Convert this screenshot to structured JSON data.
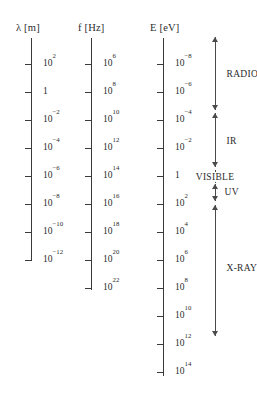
{
  "figure": {
    "type": "electromagnetic-spectrum-scale-diagram",
    "background_color": "#ffffff",
    "line_color": "#3a3a3a",
    "text_color": "#2b2b2b"
  },
  "axes": [
    {
      "id": "wavelength",
      "header": "λ [m]",
      "symbol": "λ",
      "unit": "m",
      "x": 31,
      "line_top": 38,
      "line_bottom": 260,
      "label_x": 43,
      "header_x": 16,
      "header_y": 22,
      "ticks": [
        {
          "y": 64,
          "mantissa": "10",
          "exponent": "2"
        },
        {
          "y": 92,
          "mantissa": "1",
          "exponent": ""
        },
        {
          "y": 120,
          "mantissa": "10",
          "exponent": "−2"
        },
        {
          "y": 148,
          "mantissa": "10",
          "exponent": "−4"
        },
        {
          "y": 176,
          "mantissa": "10",
          "exponent": "−6"
        },
        {
          "y": 204,
          "mantissa": "10",
          "exponent": "−8"
        },
        {
          "y": 232,
          "mantissa": "10",
          "exponent": "−10"
        },
        {
          "y": 260,
          "mantissa": "10",
          "exponent": "−12"
        }
      ]
    },
    {
      "id": "frequency",
      "header": "f [Hz]",
      "symbol": "f",
      "unit": "Hz",
      "x": 91,
      "line_top": 38,
      "line_bottom": 290,
      "label_x": 103,
      "header_x": 78,
      "header_y": 22,
      "ticks": [
        {
          "y": 64,
          "mantissa": "10",
          "exponent": "6"
        },
        {
          "y": 92,
          "mantissa": "10",
          "exponent": "8"
        },
        {
          "y": 120,
          "mantissa": "10",
          "exponent": "10"
        },
        {
          "y": 148,
          "mantissa": "10",
          "exponent": "12"
        },
        {
          "y": 176,
          "mantissa": "10",
          "exponent": "14"
        },
        {
          "y": 204,
          "mantissa": "10",
          "exponent": "16"
        },
        {
          "y": 232,
          "mantissa": "10",
          "exponent": "18"
        },
        {
          "y": 260,
          "mantissa": "10",
          "exponent": "20"
        },
        {
          "y": 288,
          "mantissa": "10",
          "exponent": "22"
        }
      ]
    },
    {
      "id": "energy",
      "header": "E [eV]",
      "symbol": "E",
      "unit": "eV",
      "x": 163,
      "line_top": 38,
      "line_bottom": 376,
      "label_x": 175,
      "header_x": 150,
      "header_y": 22,
      "ticks": [
        {
          "y": 64,
          "mantissa": "10",
          "exponent": "−8"
        },
        {
          "y": 92,
          "mantissa": "10",
          "exponent": "−6"
        },
        {
          "y": 120,
          "mantissa": "10",
          "exponent": "−4"
        },
        {
          "y": 148,
          "mantissa": "10",
          "exponent": "−2"
        },
        {
          "y": 176,
          "mantissa": "1",
          "exponent": ""
        },
        {
          "y": 204,
          "mantissa": "10",
          "exponent": "2"
        },
        {
          "y": 232,
          "mantissa": "10",
          "exponent": "4"
        },
        {
          "y": 260,
          "mantissa": "10",
          "exponent": "6"
        },
        {
          "y": 288,
          "mantissa": "10",
          "exponent": "8"
        },
        {
          "y": 316,
          "mantissa": "10",
          "exponent": "10"
        },
        {
          "y": 344,
          "mantissa": "10",
          "exponent": "12"
        },
        {
          "y": 372,
          "mantissa": "10",
          "exponent": "14"
        }
      ]
    }
  ],
  "bands": {
    "arrow_x": 215,
    "items": [
      {
        "id": "radio",
        "label": "RADIO",
        "top": 37,
        "bottom": 110,
        "label_y": 74,
        "label_placement": "right",
        "label_offset_x": 10,
        "arrow_top": true,
        "arrow_bottom": true
      },
      {
        "id": "ir",
        "label": "IR",
        "top": 113,
        "bottom": 167,
        "label_y": 141,
        "label_placement": "right",
        "label_offset_x": 10,
        "arrow_top": true,
        "arrow_bottom": true
      },
      {
        "id": "visible",
        "label": "VISIBLE",
        "top": 170,
        "bottom": 183,
        "label_y": 177,
        "label_placement": "centered",
        "label_offset_x": 0,
        "arrow_top": false,
        "arrow_bottom": false
      },
      {
        "id": "uv",
        "label": "UV",
        "top": 184,
        "bottom": 201,
        "label_y": 192,
        "label_placement": "right",
        "label_offset_x": 8,
        "arrow_top": true,
        "arrow_bottom": true
      },
      {
        "id": "x-rays",
        "label": "X-RAYS",
        "top": 205,
        "bottom": 336,
        "label_y": 268,
        "label_placement": "right",
        "label_offset_x": 10,
        "arrow_top": true,
        "arrow_bottom": true
      }
    ]
  }
}
